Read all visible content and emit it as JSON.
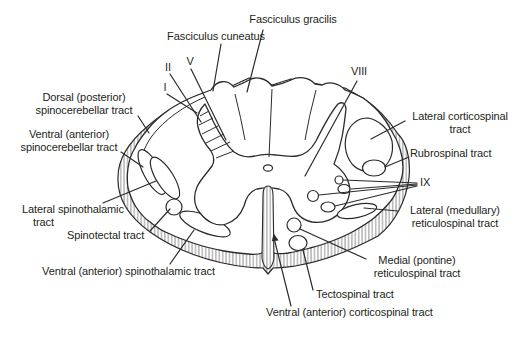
{
  "colors": {
    "line": "#2b2b2b",
    "text": "#231f20",
    "bg": "#ffffff",
    "hatch": "#555555"
  },
  "labels": {
    "fasciculus_gracilis": "Fasciculus gracilis",
    "fasciculus_cuneatus": "Fasciculus cuneatus",
    "lamina_i": "I",
    "lamina_ii": "II",
    "lamina_v": "V",
    "lamina_viii": "VIII",
    "lamina_ix": "IX",
    "dorsal_spinocerebellar": {
      "line1": "Dorsal (posterior)",
      "line2": "spinocerebellar tract"
    },
    "ventral_spinocerebellar": {
      "line1": "Ventral (anterior)",
      "line2": "spinocerebellar tract"
    },
    "lateral_spinothalamic": {
      "line1": "Lateral spinothalamic",
      "line2": "tract"
    },
    "spinotectal": "Spinotectal tract",
    "ventral_spinothalamic": "Ventral (anterior) spinothalamic tract",
    "lateral_corticospinal": {
      "line1": "Lateral corticospinal",
      "line2": "tract"
    },
    "rubrospinal": "Rubrospinal tract",
    "lateral_reticulospinal": {
      "line1": "Lateral (medullary)",
      "line2": "reticulospinal tract"
    },
    "medial_reticulospinal": {
      "line1": "Medial (pontine)",
      "line2": "reticulospinal tract"
    },
    "tectospinal": "Tectospinal tract",
    "ventral_corticospinal": "Ventral (anterior) corticospinal tract"
  }
}
